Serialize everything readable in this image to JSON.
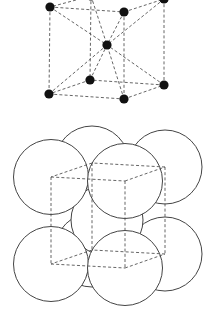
{
  "diagram": {
    "title": "",
    "type": "body-centered-cubic-unit-cell",
    "colors": {
      "background": "#ffffff",
      "atom": "#111111",
      "edge": "#555555",
      "sphere_stroke": "#444444"
    },
    "top_view": {
      "label": "",
      "style": "ball-and-stick",
      "corner_atoms": [
        {
          "name": "front-top-left",
          "x": 50,
          "y": 7
        },
        {
          "name": "front-top-right",
          "x": 124,
          "y": 12
        },
        {
          "name": "back-top-left",
          "x": 91,
          "y": -4
        },
        {
          "name": "back-top-right",
          "x": 164,
          "y": -1
        },
        {
          "name": "front-bottom-left",
          "x": 49,
          "y": 94
        },
        {
          "name": "front-bottom-right",
          "x": 124,
          "y": 99
        },
        {
          "name": "back-bottom-left",
          "x": 90,
          "y": 80
        },
        {
          "name": "back-bottom-right",
          "x": 164,
          "y": 85
        }
      ],
      "body_center_atom": {
        "x": 107,
        "y": 45
      }
    },
    "bottom_view": {
      "label": "",
      "style": "hard-sphere packing",
      "sphere_radius": 37,
      "corner_spheres": [
        {
          "name": "back-top-left",
          "x": 92,
          "y": 163
        },
        {
          "name": "back-top-right",
          "x": 165,
          "y": 167
        },
        {
          "name": "back-bottom-left",
          "x": 92,
          "y": 250
        },
        {
          "name": "back-bottom-right",
          "x": 165,
          "y": 254
        },
        {
          "name": "front-top-left",
          "x": 51,
          "y": 177
        },
        {
          "name": "front-top-right",
          "x": 125,
          "y": 181
        },
        {
          "name": "front-bottom-left",
          "x": 51,
          "y": 264
        },
        {
          "name": "front-bottom-right",
          "x": 125,
          "y": 268
        }
      ],
      "body_center_sphere": {
        "x": 107,
        "y": 220
      }
    }
  }
}
